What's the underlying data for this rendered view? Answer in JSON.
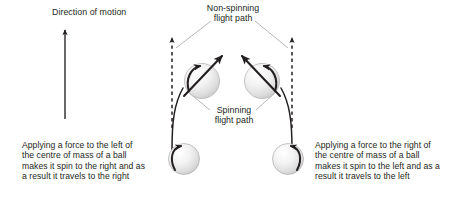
{
  "figure": {
    "title_visible": false,
    "background_color": "#ffffff",
    "text_color": "#231f20",
    "ball_fill_color": "#e6e6e6",
    "ball_stroke_color": "#9a9a9a",
    "arrow_color": "#231f20",
    "leader_line_color": "#9a9a9a"
  },
  "labels": {
    "direction_of_motion": "Direction of motion",
    "non_spinning_flight_path": "Non-spinning\nflight path",
    "spinning_flight_path": "Spinning\nflight path"
  },
  "captions": {
    "left": "Applying a force to the left of the centre of mass of a ball makes it spin to the right and as a result it travels to the right",
    "right": "Applying a force to the right of the centre of mass of a ball makes it spin to the left and as a result it travels to the left"
  },
  "elements": {
    "direction_arrow": {
      "name": "direction-of-motion-arrow",
      "orientation": "up"
    },
    "dashed_paths": [
      {
        "name": "non-spinning-path-left",
        "style": "dashed",
        "arrow": "up"
      },
      {
        "name": "non-spinning-path-right",
        "style": "dashed",
        "arrow": "up"
      }
    ],
    "curved_paths": [
      {
        "name": "spinning-path-left",
        "style": "solid",
        "curves": "right"
      },
      {
        "name": "spinning-path-right",
        "style": "solid",
        "curves": "left"
      }
    ],
    "balls": [
      {
        "name": "ball-lower-left",
        "spin": "right",
        "position": "start-left"
      },
      {
        "name": "ball-lower-right",
        "spin": "left",
        "position": "start-right"
      },
      {
        "name": "ball-upper-left",
        "spin": "right",
        "velocity": "up-right"
      },
      {
        "name": "ball-upper-right",
        "spin": "left",
        "velocity": "up-left"
      }
    ]
  }
}
